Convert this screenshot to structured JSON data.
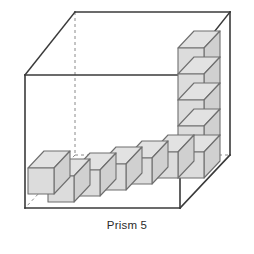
{
  "figure": {
    "name": "unit-cube-volume-diagram",
    "caption": "Prism 5",
    "colors": {
      "cube_top": "#e2e2e2",
      "cube_front": "#dcdcdc",
      "cube_side": "#d0d0d0",
      "cube_edge": "#6f6f6f",
      "prism_edge": "#3a3a3a",
      "hidden_edge": "#8a8a8a",
      "background": "#ffffff",
      "caption_text": "#2b2b2b"
    },
    "prism": {
      "label": "open rectangular prism outline",
      "visible_edges": "solid",
      "hidden_edges": "dashed",
      "vertices": {
        "front_bottom_left": [
          25,
          208
        ],
        "front_bottom_right": [
          180,
          208
        ],
        "front_top_left": [
          25,
          75
        ],
        "front_top_right": [
          180,
          75
        ],
        "back_bottom_left": [
          75,
          155
        ],
        "back_bottom_right": [
          230,
          155
        ],
        "back_top_left": [
          75,
          12
        ],
        "back_top_right": [
          230,
          12
        ]
      }
    },
    "cubes": {
      "total_count": 10,
      "arrangement": "L-shape: one row of cubes along the bottom front edge plus one vertical column at the right rear",
      "row": {
        "name": "bottom-row",
        "count": 6,
        "direction": "left-to-right along the bottom front of the prism"
      },
      "column": {
        "name": "vertical-column",
        "count": 5,
        "direction": "bottom-to-top at the right rear corner of the prism"
      },
      "shared_corner_cube": 1
    },
    "geometry": {
      "cube_width": 26,
      "cube_height": 26,
      "depth_dx": 16,
      "depth_dy": -17
    }
  }
}
